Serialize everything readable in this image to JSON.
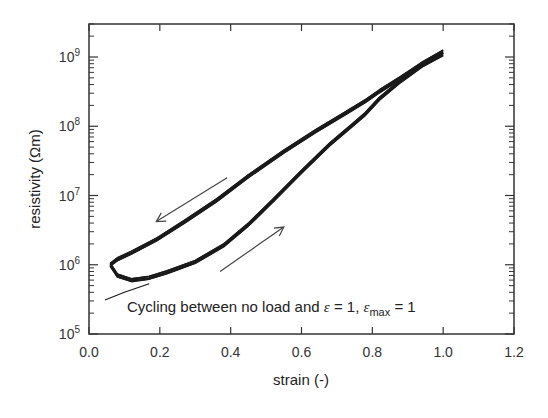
{
  "chart_data": {
    "type": "line",
    "title": "",
    "xlabel": "strain (-)",
    "ylabel": "resistivity (Ωm)",
    "xlim": [
      0.0,
      1.2
    ],
    "ylim": [
      100000.0,
      3000000000.0
    ],
    "yscale": "log",
    "grid": false,
    "legend": null,
    "x_ticks": [
      "0.0",
      "0.2",
      "0.4",
      "0.6",
      "0.8",
      "1.0",
      "1.2"
    ],
    "y_ticks": [
      {
        "base": "10",
        "exp": "5"
      },
      {
        "base": "10",
        "exp": "6"
      },
      {
        "base": "10",
        "exp": "7"
      },
      {
        "base": "10",
        "exp": "8"
      },
      {
        "base": "10",
        "exp": "9"
      }
    ],
    "annotation": {
      "prefix": "Cycling between no load and ",
      "eps": "ε",
      "mid": " = 1, ",
      "eps2": "ε",
      "sub": "max",
      "suffix": " = 1"
    },
    "arrows": [
      {
        "direction": "unloading",
        "from": [
          0.39,
          18000000.0
        ],
        "to": [
          0.19,
          4200000.0
        ]
      },
      {
        "direction": "loading",
        "from": [
          0.37,
          800000.0
        ],
        "to": [
          0.55,
          3500000.0
        ]
      }
    ],
    "series": [
      {
        "name": "loading",
        "x": [
          0.06,
          0.08,
          0.12,
          0.17,
          0.22,
          0.3,
          0.38,
          0.45,
          0.52,
          0.6,
          0.68,
          0.74,
          0.78,
          0.82,
          0.88,
          0.94,
          1.0
        ],
        "y": [
          1000000.0,
          700000.0,
          600000.0,
          650000.0,
          780000.0,
          1100000.0,
          1900000.0,
          3800000.0,
          8500000.0,
          22000000.0,
          55000000.0,
          100000000.0,
          150000000.0,
          250000000.0,
          450000000.0,
          750000000.0,
          1100000000.0
        ]
      },
      {
        "name": "unloading",
        "x": [
          1.0,
          0.94,
          0.88,
          0.82,
          0.78,
          0.72,
          0.64,
          0.55,
          0.45,
          0.36,
          0.27,
          0.19,
          0.12,
          0.08,
          0.06
        ],
        "y": [
          1200000000.0,
          800000000.0,
          500000000.0,
          320000000.0,
          230000000.0,
          150000000.0,
          85000000.0,
          43000000.0,
          19000000.0,
          8500000.0,
          4200000.0,
          2300000.0,
          1500000.0,
          1200000.0,
          1000000.0
        ]
      },
      {
        "name": "initial",
        "x": [
          0.045,
          0.1,
          0.17
        ],
        "y": [
          310000.0,
          400000.0,
          530000.0
        ]
      }
    ]
  }
}
